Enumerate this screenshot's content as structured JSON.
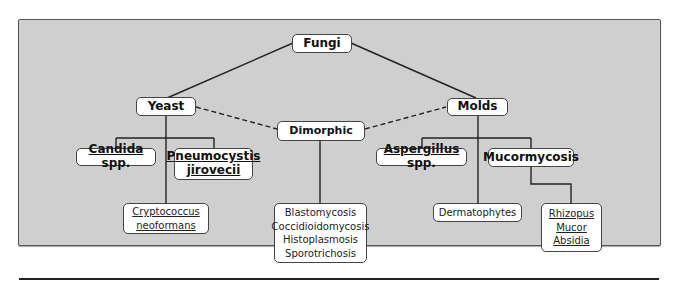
{
  "diagram": {
    "root": {
      "label": "Fungi"
    },
    "categories": {
      "yeast": {
        "label": "Yeast"
      },
      "molds": {
        "label": "Molds"
      },
      "dimorphic": {
        "label": "Dimorphic"
      }
    },
    "yeast_children": {
      "candida": {
        "underlined": "Candida",
        "rest": " spp."
      },
      "pneumocystis": {
        "line1": "Pneumocystis",
        "line2": "jirovecii"
      },
      "cryptococcus": {
        "line1": "Cryptococcus",
        "line2": "neoformans"
      }
    },
    "dimorphic_children": {
      "items": [
        "Blastomycosis",
        "Coccidioidomycosis",
        "Histoplasmosis",
        "Sporotrichosis"
      ]
    },
    "molds_children": {
      "aspergillus": {
        "underlined": "Aspergillus",
        "rest": " spp."
      },
      "mucormycosis": {
        "label": "Mucormycosis"
      },
      "dermatophytes": {
        "label": "Dermatophytes"
      },
      "mucor_genera": {
        "items": [
          "Rhizopus",
          "Mucor",
          "Absidia"
        ]
      }
    },
    "connectors": {
      "solid": [
        "Fungi-Yeast",
        "Fungi-Molds",
        "Yeast-Candida",
        "Yeast-Pneumocystis",
        "Yeast-Cryptococcus",
        "Dimorphic-List",
        "Molds-Aspergillus",
        "Molds-Mucormycosis",
        "Molds-Dermatophytes",
        "Mucormycosis-Genera"
      ],
      "dashed": [
        "Yeast-Dimorphic",
        "Dimorphic-Molds"
      ]
    }
  }
}
